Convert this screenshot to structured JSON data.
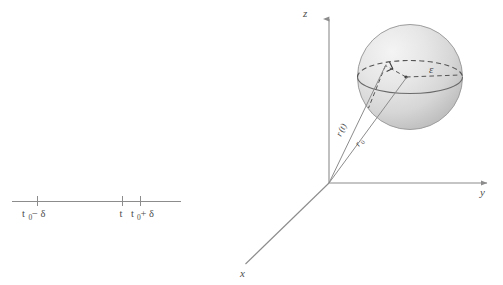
{
  "figure": {
    "background_color": "#ffffff",
    "ink_color": "#4d4d4d",
    "line_color": "#8c8c8c"
  },
  "number_line": {
    "name": "t-axis",
    "ticks": [
      {
        "id": "left",
        "label_main": "t",
        "label_sub": "0",
        "label_op": " − δ"
      },
      {
        "id": "center",
        "label_main": "t",
        "label_sub": "",
        "label_op": ""
      },
      {
        "id": "right",
        "label_main": "t",
        "label_sub": "0",
        "label_op": " + δ"
      }
    ],
    "labels_plain": [
      "t₀ − δ",
      "t",
      "t₀ + δ"
    ]
  },
  "axes": {
    "z": {
      "label": "z"
    },
    "y": {
      "label": "y"
    },
    "x": {
      "label": "x"
    },
    "origin_label": ""
  },
  "sphere": {
    "name": "epsilon-ball",
    "fill_light": "#efefef",
    "fill_dark": "#c9c9c9",
    "outline_color": "#9a9a9a",
    "radius_label": "ε"
  },
  "vectors": [
    {
      "id": "r-of-t",
      "label_main": "r",
      "label_sub": "(t)",
      "plain": "r(t)"
    },
    {
      "id": "r-naught",
      "label_main": "r",
      "label_sub": "0",
      "plain": "r₀"
    }
  ],
  "markers": {
    "right_angle": "right-angle-marker",
    "center_point": "ball-center-point"
  }
}
